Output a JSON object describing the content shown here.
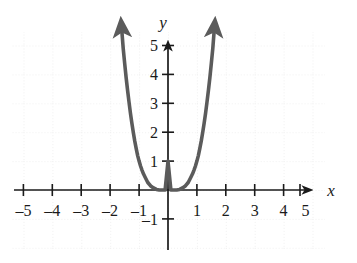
{
  "chart_data": {
    "type": "line",
    "title": "",
    "subtitle": "",
    "xlabel": "x",
    "ylabel": "y",
    "xlim": [
      -5.4,
      5.1
    ],
    "ylim": [
      -1.6,
      5.9
    ],
    "grid": true,
    "legend": null,
    "function": "y = (x^2 - 1)^2",
    "x_ticks": [
      -5,
      -4,
      -3,
      -2,
      -1,
      1,
      2,
      3,
      4,
      5
    ],
    "x_tick_labels": [
      "–5",
      "–4",
      "–3",
      "–2",
      "–1",
      "1",
      "2",
      "3",
      "4",
      "5"
    ],
    "y_ticks": [
      -1,
      1,
      2,
      3,
      4,
      5
    ],
    "y_tick_labels": [
      "–1",
      "1",
      "2",
      "3",
      "4",
      "5"
    ],
    "series": [
      {
        "name": "quartic",
        "color": "#5b5b5b",
        "arrow_start": true,
        "arrow_end": true,
        "x": [
          -1.62,
          -1.55,
          -1.5,
          -1.45,
          -1.4,
          -1.35,
          -1.3,
          -1.25,
          -1.2,
          -1.15,
          -1.1,
          -1.05,
          -1.0,
          -0.95,
          -0.9,
          -0.85,
          -0.8,
          -0.7,
          -0.6,
          -0.5,
          -0.4,
          -0.3,
          -0.2,
          -0.1,
          0.0,
          0.1,
          0.2,
          0.3,
          0.4,
          0.5,
          0.6,
          0.7,
          0.8,
          0.85,
          0.9,
          0.95,
          1.0,
          1.05,
          1.1,
          1.15,
          1.2,
          1.25,
          1.3,
          1.35,
          1.4,
          1.45,
          1.5,
          1.55,
          1.62
        ],
        "y": [
          5.8,
          4.9,
          4.39,
          3.9,
          3.46,
          3.05,
          2.66,
          2.31,
          1.99,
          1.69,
          1.43,
          1.19,
          1.0,
          0.83,
          0.69,
          0.56,
          0.46,
          0.26,
          0.14,
          0.07,
          0.02,
          0.0,
          0.0,
          0.0,
          1.0,
          0.0,
          0.0,
          0.0,
          0.02,
          0.07,
          0.14,
          0.26,
          0.46,
          0.56,
          0.69,
          0.83,
          1.0,
          1.19,
          1.43,
          1.69,
          1.99,
          2.31,
          2.66,
          3.05,
          3.46,
          3.9,
          4.39,
          4.9,
          5.8
        ]
      }
    ],
    "key_points": [
      {
        "x": -1,
        "y": 0,
        "label": "root (touch)"
      },
      {
        "x": 0,
        "y": 1,
        "label": "local maximum"
      },
      {
        "x": 1,
        "y": 0,
        "label": "root (touch)"
      }
    ],
    "colors": {
      "curve": "#5b5b5b",
      "axis": "#1a1a1a",
      "grid": "#e0e0e0",
      "background": "#ffffff",
      "text": "#1a1a1a"
    }
  }
}
